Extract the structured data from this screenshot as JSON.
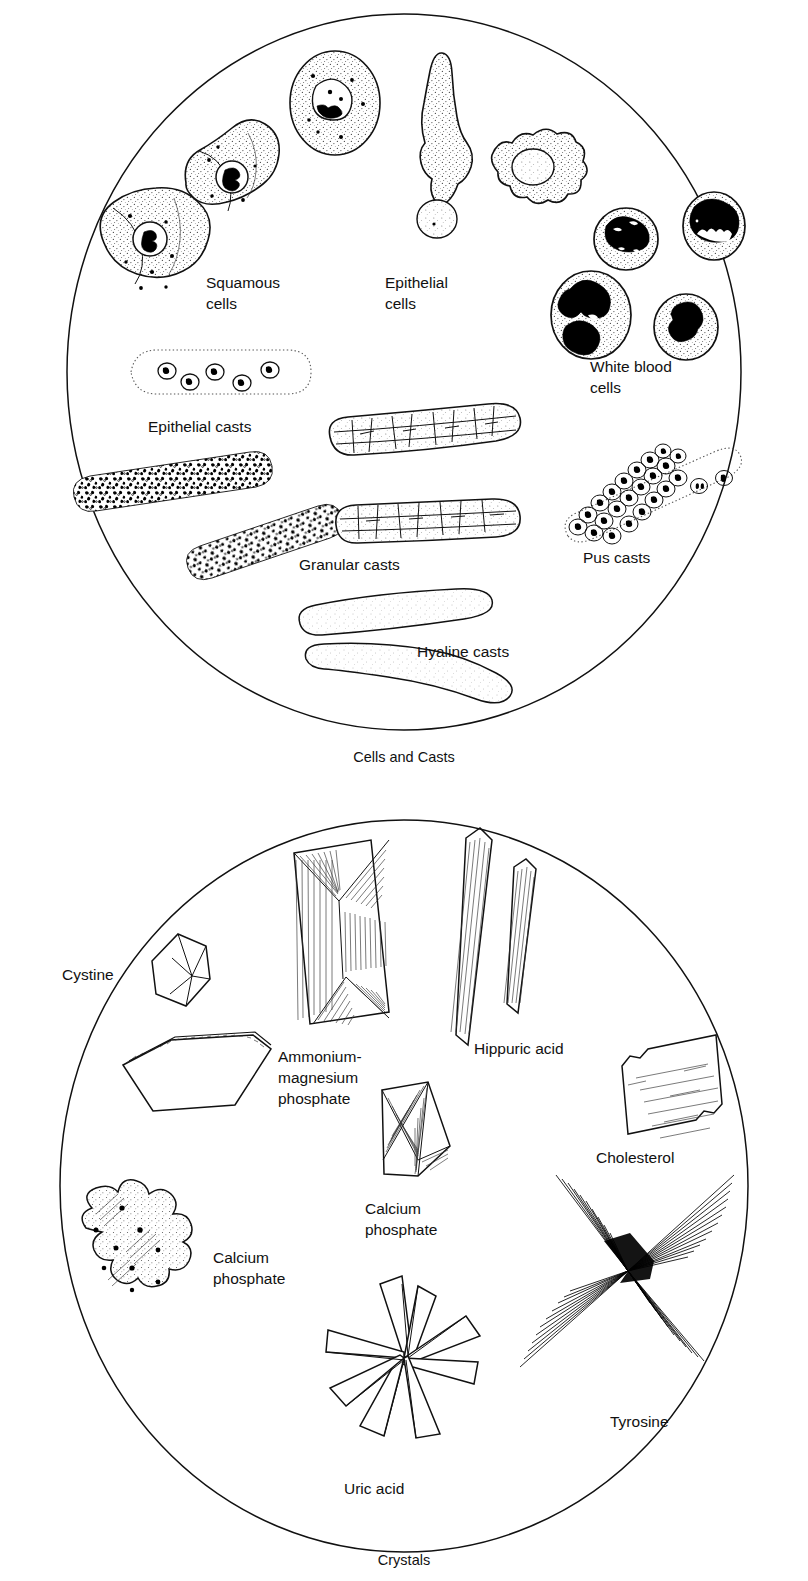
{
  "figure": {
    "style": "line-drawing",
    "panels": [
      {
        "id": "cells-and-casts",
        "caption": "Cells and Casts",
        "shape": "circle",
        "labels": [
          {
            "key": "squamous-cells",
            "lines": [
              "Squamous",
              "cells"
            ],
            "count": 2
          },
          {
            "key": "epithelial-cells",
            "lines": [
              "Epithelial",
              "cells"
            ],
            "count": 3
          },
          {
            "key": "white-blood-cells",
            "lines": [
              "White blood",
              "cells"
            ],
            "count": 4
          },
          {
            "key": "epithelial-casts",
            "lines": [
              "Epithelial casts"
            ],
            "count": 1
          },
          {
            "key": "granular-casts",
            "lines": [
              "Granular casts"
            ],
            "count": 4
          },
          {
            "key": "pus-casts",
            "lines": [
              "Pus casts"
            ],
            "count": 1
          },
          {
            "key": "hyaline-casts",
            "lines": [
              "Hyaline casts"
            ],
            "count": 2
          }
        ]
      },
      {
        "id": "crystals",
        "caption": "Crystals",
        "shape": "circle",
        "labels": [
          {
            "key": "cystine",
            "lines": [
              "Cystine"
            ],
            "count": 2
          },
          {
            "key": "ammonium-magnesium-phosphate",
            "lines": [
              "Ammonium-",
              "magnesium",
              "phosphate"
            ],
            "count": 1
          },
          {
            "key": "hippuric-acid",
            "lines": [
              "Hippuric acid"
            ],
            "count": 2
          },
          {
            "key": "cholesterol",
            "lines": [
              "Cholesterol"
            ],
            "count": 1
          },
          {
            "key": "calcium-phosphate-wedge",
            "lines": [
              "Calcium",
              "phosphate"
            ],
            "count": 1
          },
          {
            "key": "calcium-phosphate-amorphous",
            "lines": [
              "Calcium",
              "phosphate"
            ],
            "count": 1
          },
          {
            "key": "tyrosine",
            "lines": [
              "Tyrosine"
            ],
            "count": 1
          },
          {
            "key": "uric-acid",
            "lines": [
              "Uric acid"
            ],
            "count": 1
          }
        ]
      }
    ]
  },
  "cells_panel": {
    "caption": "Cells and Casts",
    "squamous_label_l1": "Squamous",
    "squamous_label_l2": "cells",
    "epithelial_cells_label_l1": "Epithelial",
    "epithelial_cells_label_l2": "cells",
    "wbc_label_l1": "White blood",
    "wbc_label_l2": "cells",
    "epithelial_casts_label": "Epithelial casts",
    "granular_casts_label": "Granular casts",
    "pus_casts_label": "Pus casts",
    "hyaline_casts_label": "Hyaline casts"
  },
  "crystals_panel": {
    "caption": "Crystals",
    "cystine_label": "Cystine",
    "struvite_label_l1": "Ammonium-",
    "struvite_label_l2": "magnesium",
    "struvite_label_l3": "phosphate",
    "hippuric_label": "Hippuric acid",
    "cholesterol_label": "Cholesterol",
    "calcium_phosphate_wedge_label_l1": "Calcium",
    "calcium_phosphate_wedge_label_l2": "phosphate",
    "calcium_phosphate_amorphous_label_l1": "Calcium",
    "calcium_phosphate_amorphous_label_l2": "phosphate",
    "tyrosine_label": "Tyrosine",
    "uric_acid_label": "Uric acid"
  },
  "colors": {
    "ink": "#111111",
    "background": "#ffffff",
    "nucleus_dark": "#000000",
    "stipple": "#6b6b6b"
  }
}
